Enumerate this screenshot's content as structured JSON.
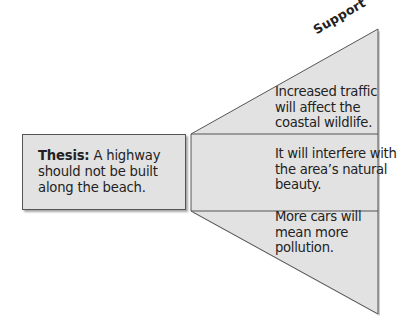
{
  "diagram": {
    "support_label": "Support",
    "thesis": {
      "lead": "Thesis:",
      "text": " A highway should not be built along the beach."
    },
    "supports": [
      {
        "text": "Increased traffic will affect the coastal wildlife."
      },
      {
        "text": "It will interfere with the area’s natural beauty."
      },
      {
        "text": "More cars will mean more pollution."
      }
    ],
    "colors": {
      "fill": "#e2e2e2",
      "stroke": "#555555",
      "shadow": "#9a9a9a"
    }
  }
}
